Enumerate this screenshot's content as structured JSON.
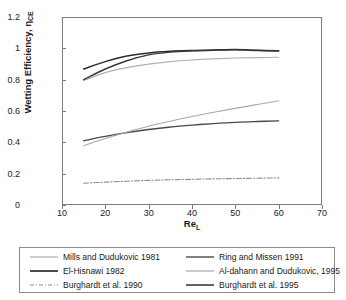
{
  "chart_data": {
    "type": "line",
    "title": "",
    "xlabel": "Re",
    "xlabel_sub": "L",
    "ylabel": "Wetting Efficiency, η",
    "ylabel_sub": "CE",
    "xlim": [
      10,
      70
    ],
    "ylim": [
      0,
      1.2
    ],
    "xticks": [
      10,
      20,
      30,
      40,
      50,
      60,
      70
    ],
    "yticks": [
      "0",
      "0.2",
      "0.4",
      "0.6",
      "0.8",
      "1",
      "1.2"
    ],
    "ytick_values": [
      0,
      0.2,
      0.4,
      0.6,
      0.8,
      1.0,
      1.2
    ],
    "grid": false,
    "legend_position": "below",
    "series": [
      {
        "name": "Mills and Dudukovic 1981",
        "color": "#b0b0b0",
        "style": "solid",
        "width": 1.1,
        "x": [
          15,
          20,
          25,
          30,
          35,
          40,
          45,
          50,
          55,
          60
        ],
        "y": [
          0.795,
          0.845,
          0.877,
          0.899,
          0.915,
          0.926,
          0.933,
          0.938,
          0.941,
          0.943
        ]
      },
      {
        "name": "El-Hisnawi 1982",
        "color": "#2b2b2b",
        "style": "solid",
        "width": 1.5,
        "x": [
          15,
          20,
          25,
          30,
          35,
          40,
          45,
          50,
          55,
          60
        ],
        "y": [
          0.868,
          0.915,
          0.951,
          0.971,
          0.981,
          0.986,
          0.989,
          0.992,
          0.988,
          0.985
        ]
      },
      {
        "name": "Burghardt et al. 1990",
        "color": "#8c8c8c",
        "style": "dashdot",
        "width": 1.1,
        "x": [
          15,
          20,
          25,
          30,
          35,
          40,
          45,
          50,
          55,
          60
        ],
        "y": [
          0.139,
          0.146,
          0.152,
          0.157,
          0.161,
          0.164,
          0.167,
          0.169,
          0.171,
          0.173
        ]
      },
      {
        "name": "Ring and Missen 1991",
        "color": "#4a4a4a",
        "style": "solid",
        "width": 1.3,
        "x": [
          15,
          20,
          25,
          30,
          35,
          40,
          45,
          50,
          55,
          60
        ],
        "y": [
          0.41,
          0.438,
          0.462,
          0.482,
          0.498,
          0.51,
          0.52,
          0.528,
          0.533,
          0.537
        ]
      },
      {
        "name": "Al-dahann and Dudukovic, 1995",
        "color": "#a8a8a8",
        "style": "solid",
        "width": 1.1,
        "x": [
          15,
          20,
          25,
          30,
          35,
          40,
          45,
          50,
          55,
          60
        ],
        "y": [
          0.378,
          0.424,
          0.466,
          0.503,
          0.535,
          0.565,
          0.592,
          0.617,
          0.641,
          0.665
        ]
      },
      {
        "name": "Burghardt et al. 1995",
        "color": "#3a3a3a",
        "style": "solid",
        "width": 1.4,
        "x": [
          15,
          20,
          25,
          30,
          35,
          40,
          45,
          50,
          55,
          60
        ],
        "y": [
          0.8,
          0.868,
          0.921,
          0.958,
          0.976,
          0.984,
          0.988,
          0.99,
          0.986,
          0.983
        ]
      }
    ]
  },
  "legend": {
    "entries": [
      {
        "label": "Mills and Dudukovic 1981",
        "color": "#b0b0b0",
        "style": "solid",
        "width": 1.2
      },
      {
        "label": "Ring and Missen 1991",
        "color": "#4a4a4a",
        "style": "solid",
        "width": 1.4
      },
      {
        "label": "El-Hisnawi 1982",
        "color": "#2b2b2b",
        "style": "solid",
        "width": 1.7
      },
      {
        "label": "Al-dahann and Dudukovic, 1995",
        "color": "#a8a8a8",
        "style": "solid",
        "width": 1.2
      },
      {
        "label": "Burghardt et al. 1990",
        "color": "#8c8c8c",
        "style": "dashdot",
        "width": 1.2
      },
      {
        "label": "Burghardt et al. 1995",
        "color": "#3a3a3a",
        "style": "solid",
        "width": 1.6
      }
    ]
  },
  "axes": {
    "frame_color": "#7d7d7d"
  }
}
